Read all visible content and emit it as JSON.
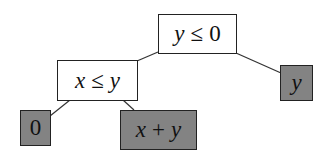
{
  "diagram": {
    "type": "decision-tree",
    "colors": {
      "decision_fill": "#ffffff",
      "leaf_fill": "#838383",
      "border": "#222222",
      "edge": "#333333"
    },
    "nodes": {
      "root": {
        "kind": "decision",
        "lhs": "y",
        "op": "≤",
        "rhs": "0"
      },
      "left": {
        "kind": "decision",
        "lhs": "x",
        "op": "≤",
        "rhs": "y"
      },
      "right_leaf": {
        "kind": "leaf",
        "expr": "y"
      },
      "left_left_leaf": {
        "kind": "leaf",
        "expr": "0"
      },
      "left_right_leaf": {
        "kind": "leaf",
        "lhs": "x",
        "op": "+",
        "rhs": "y"
      }
    },
    "edges": [
      {
        "from": "root",
        "to": "left"
      },
      {
        "from": "root",
        "to": "right_leaf"
      },
      {
        "from": "left",
        "to": "left_left_leaf"
      },
      {
        "from": "left",
        "to": "left_right_leaf"
      }
    ]
  }
}
